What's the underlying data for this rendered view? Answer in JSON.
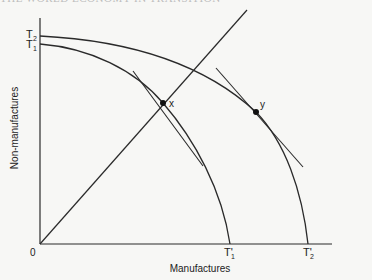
{
  "header": {
    "partial_text": "THE WORLD ECONOMY IN TRANSITION"
  },
  "diagram": {
    "y_axis_label": "Non-manufactures",
    "x_axis_label": "Manufactures",
    "origin_label": "0",
    "curves": [
      {
        "name": "T1",
        "label_y": "T1",
        "label_x": "T'1"
      },
      {
        "name": "T2",
        "label_y": "T2",
        "label_x": "T'2"
      }
    ],
    "points": [
      {
        "name": "x",
        "label": "x"
      },
      {
        "name": "y",
        "label": "y"
      }
    ],
    "labels": {
      "t2_main": "T",
      "t2_sub": "2",
      "t1_main": "T",
      "t1_sub": "1",
      "t1p_main": "T'",
      "t1p_sub": "1",
      "t2p_main": "T'",
      "t2p_sub": "2",
      "point_x": "x",
      "point_y": "y"
    },
    "colors": {
      "line": "#2a2a2a",
      "background": "#f7f7f5"
    }
  }
}
